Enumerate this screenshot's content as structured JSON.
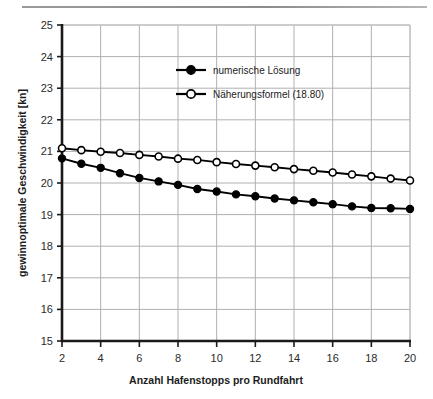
{
  "figure": {
    "header_rule": "horizontal-rule"
  },
  "chart_data": {
    "type": "line",
    "title": "",
    "xlabel": "Anzahl Hafenstopps pro Rundfahrt",
    "ylabel": "gewinnoptimale Geschwindigkeit [kn]",
    "xlim": [
      2,
      20
    ],
    "ylim": [
      15,
      25
    ],
    "xticks": [
      2,
      4,
      6,
      8,
      10,
      12,
      14,
      16,
      18,
      20
    ],
    "yticks": [
      15,
      16,
      17,
      18,
      19,
      20,
      21,
      22,
      23,
      24,
      25
    ],
    "xtick_labels": [
      "2",
      "4",
      "6",
      "8",
      "10",
      "12",
      "14",
      "16",
      "18",
      "20"
    ],
    "ytick_labels": [
      "15",
      "16",
      "17",
      "18",
      "19",
      "20",
      "21",
      "22",
      "23",
      "24",
      "25"
    ],
    "grid": true,
    "legend_position": "upper-center",
    "x": [
      2,
      3,
      4,
      5,
      6,
      7,
      8,
      9,
      10,
      11,
      12,
      13,
      14,
      15,
      16,
      17,
      18,
      19,
      20
    ],
    "series": [
      {
        "name": "numerische Lösung",
        "marker": "filled-circle",
        "color": "#000000",
        "values": [
          20.78,
          20.61,
          20.48,
          20.31,
          20.16,
          20.05,
          19.94,
          19.81,
          19.73,
          19.64,
          19.58,
          19.51,
          19.45,
          19.39,
          19.33,
          19.26,
          19.21,
          19.2,
          19.18
        ]
      },
      {
        "name": "Näherungsformel (18.80)",
        "marker": "open-circle",
        "color": "#000000",
        "values": [
          21.1,
          21.04,
          20.99,
          20.95,
          20.89,
          20.84,
          20.77,
          20.73,
          20.66,
          20.6,
          20.55,
          20.5,
          20.44,
          20.39,
          20.33,
          20.27,
          20.21,
          20.14,
          20.08
        ]
      }
    ],
    "legend_entries": [
      "numerische Lösung",
      "Näherungsformel (18.80)"
    ],
    "colors": {
      "series_line": "#000000",
      "grid": "#b0b0b0",
      "axis": "#1a1a1a",
      "frame": "#c0c0c0"
    }
  }
}
